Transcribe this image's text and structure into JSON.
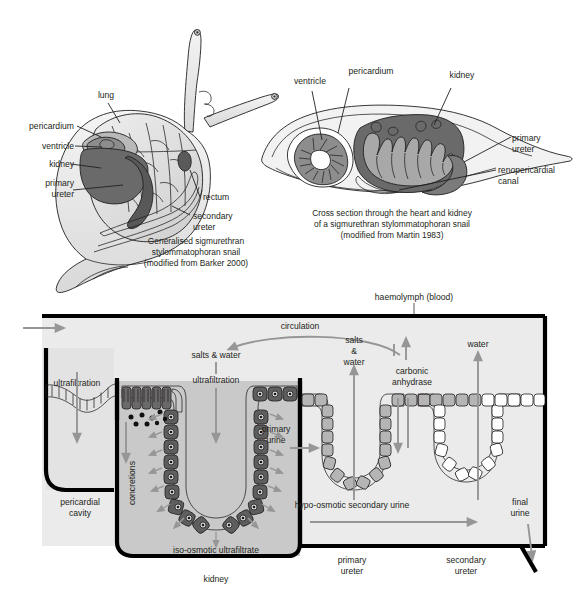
{
  "figure": {
    "palette": {
      "ink": "#231f20",
      "arrow_gray": "#969696",
      "kidney_dark": "#6a6a6a",
      "kidney_mid": "#8d8d8d",
      "body_light": "#ededed",
      "body_mid": "#d6d6d6",
      "box_fill": "#ebebeb",
      "kidney_box_fill": "#c9c9c9",
      "ureter_cell": "#b5b5b5",
      "white": "#ffffff",
      "black": "#000000"
    }
  },
  "panel_a": {
    "caption_lines": [
      "Generalised sigmurethran",
      "stylommatophoran snail",
      "(modified from Barker 2000)"
    ],
    "labels": [
      {
        "key": "lung",
        "text": "lung"
      },
      {
        "key": "pericardium",
        "text": "pericardium"
      },
      {
        "key": "ventricle",
        "text": "ventricle"
      },
      {
        "key": "kidney",
        "text": "kidney"
      },
      {
        "key": "primary_ureter_1",
        "text": "primary"
      },
      {
        "key": "primary_ureter_2",
        "text": "ureter"
      },
      {
        "key": "rectum",
        "text": "rectum"
      },
      {
        "key": "secondary_ureter_1",
        "text": "secondary"
      },
      {
        "key": "secondary_ureter_2",
        "text": "ureter"
      }
    ]
  },
  "panel_b": {
    "caption_lines": [
      "Cross section through the heart and kidney",
      "of a sigmurethran stylommatophoran snail",
      "(modified from Martin 1983)"
    ],
    "labels": [
      {
        "key": "ventricle",
        "text": "ventricle"
      },
      {
        "key": "pericardium",
        "text": "pericardium"
      },
      {
        "key": "kidney",
        "text": "kidney"
      },
      {
        "key": "primary_ureter_1",
        "text": "primary"
      },
      {
        "key": "primary_ureter_2",
        "text": "ureter"
      },
      {
        "key": "renopericardial_1",
        "text": "renopericardial"
      },
      {
        "key": "renopericardial_2",
        "text": "canal"
      }
    ]
  },
  "panel_c": {
    "labels": {
      "haemolymph": "haemolymph (blood)",
      "circulation": "circulation",
      "ultrafiltration_left": "ultrafiltration",
      "ultrafiltration_mid": "ultrafiltration",
      "salts_and_water_mid": "salts & water",
      "salts_1": "salts",
      "salts_2": "&",
      "salts_3": "water",
      "carbonic_1": "carbonic",
      "carbonic_2": "anhydrase",
      "water": "water",
      "pericardial_cavity_1": "pericardial",
      "pericardial_cavity_2": "cavity",
      "concretions": "concretions",
      "primary_urine_1": "primary",
      "primary_urine_2": "urine",
      "iso_osmotic": "iso-osmotic ultrafiltrate",
      "hypo_osmotic": "hypo-osmotic secondary urine",
      "kidney": "kidney",
      "primary_ureter_1": "primary",
      "primary_ureter_2": "ureter",
      "secondary_ureter_1": "secondary",
      "secondary_ureter_2": "ureter",
      "final_urine_1": "final",
      "final_urine_2": "urine"
    }
  }
}
